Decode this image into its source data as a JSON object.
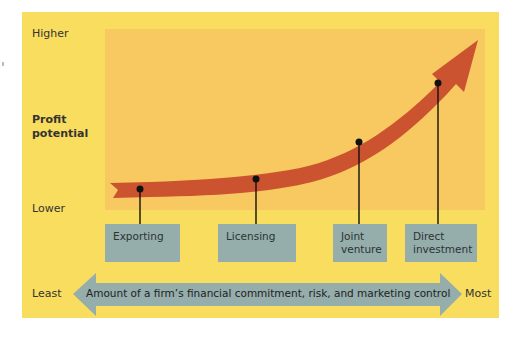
{
  "y_axis": {
    "high_label": "Higher",
    "title_line1": "Profit",
    "title_line2": "potential",
    "low_label": "Lower"
  },
  "entry_modes": [
    {
      "label_line1": "Exporting",
      "label_line2": ""
    },
    {
      "label_line1": "Licensing",
      "label_line2": ""
    },
    {
      "label_line1": "Joint",
      "label_line2": "venture"
    },
    {
      "label_line1": "Direct",
      "label_line2": "investment"
    }
  ],
  "x_axis": {
    "low_label": "Least",
    "arrow_text": "Amount of a firm’s financial commitment, risk, and marketing control",
    "high_label": "Most"
  },
  "colors": {
    "panel": "#f9dd5e",
    "plot_area": "#f8c960",
    "curve_arrow": "#cc5330",
    "boxes": "#95adab"
  }
}
